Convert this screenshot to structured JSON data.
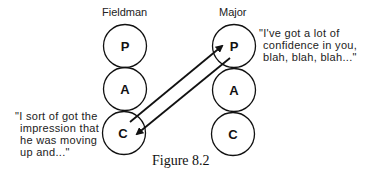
{
  "diagram": {
    "left_column": {
      "title": "Fieldman",
      "states": [
        "P",
        "A",
        "C"
      ]
    },
    "right_column": {
      "title": "Major",
      "states": [
        "P",
        "A",
        "C"
      ]
    },
    "transactions": [
      {
        "from": "Fieldman.C",
        "to": "Major.P"
      },
      {
        "from": "Major.P",
        "to": "Fieldman.C"
      }
    ],
    "quotes": {
      "major": [
        "\"I've got a lot of",
        "confidence in you,",
        "blah, blah, blah...\""
      ],
      "fieldman": [
        "\"I sort of got the",
        "impression that",
        "he was moving",
        "up and...\""
      ]
    },
    "caption": "Figure 8.2"
  }
}
